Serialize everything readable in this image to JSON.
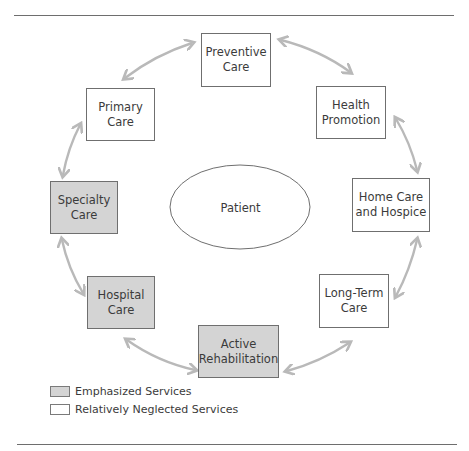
{
  "diagram": {
    "center": {
      "label": "Patient"
    },
    "nodes": [
      {
        "id": "preventive",
        "label": "Preventive\nCare",
        "type": "neglected"
      },
      {
        "id": "health-promotion",
        "label": "Health\nPromotion",
        "type": "neglected"
      },
      {
        "id": "home-care",
        "label": "Home Care\nand Hospice",
        "type": "neglected"
      },
      {
        "id": "long-term",
        "label": "Long-Term\nCare",
        "type": "neglected"
      },
      {
        "id": "active-rehab",
        "label": "Active\nRehabilitation",
        "type": "emphasized"
      },
      {
        "id": "hospital",
        "label": "Hospital\nCare",
        "type": "emphasized"
      },
      {
        "id": "specialty",
        "label": "Specialty\nCare",
        "type": "emphasized"
      },
      {
        "id": "primary",
        "label": "Primary\nCare",
        "type": "neglected"
      }
    ],
    "edges": [
      [
        "primary",
        "preventive"
      ],
      [
        "preventive",
        "health-promotion"
      ],
      [
        "health-promotion",
        "home-care"
      ],
      [
        "home-care",
        "long-term"
      ],
      [
        "long-term",
        "active-rehab"
      ],
      [
        "active-rehab",
        "hospital"
      ],
      [
        "hospital",
        "specialty"
      ],
      [
        "specialty",
        "primary"
      ]
    ],
    "edge_style": "bidirectional curved arrows"
  },
  "legend": {
    "items": [
      {
        "label": "Emphasized Services",
        "swatch": "#d4d4d4"
      },
      {
        "label": "Relatively Neglected Services",
        "swatch": "#ffffff"
      }
    ]
  },
  "colors": {
    "emphasized_fill": "#d4d4d4",
    "neglected_fill": "#ffffff",
    "arrow": "#b9b9b9",
    "border": "#6f6f6f"
  }
}
